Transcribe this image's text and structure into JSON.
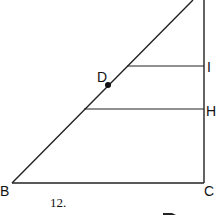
{
  "diagram": {
    "points": {
      "B": {
        "label": "B",
        "x": 12,
        "y": 183
      },
      "C": {
        "label": "C",
        "x": 204,
        "y": 183
      },
      "D": {
        "label": "D",
        "x": 108,
        "y": 85
      },
      "H": {
        "label": "H",
        "x": 204,
        "y": 109
      },
      "I": {
        "label": "I",
        "x": 204,
        "y": 66
      }
    },
    "problem_number": "12.",
    "line_color": "#222222"
  }
}
